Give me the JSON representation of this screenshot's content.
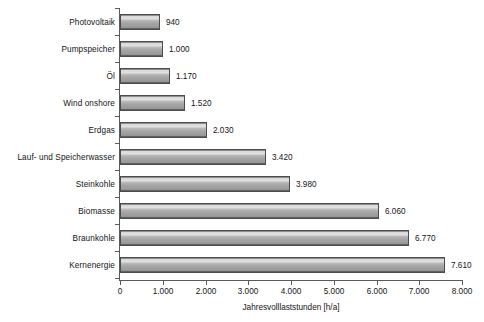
{
  "chart_data": {
    "type": "bar",
    "orientation": "horizontal",
    "title": "",
    "xlabel": "Jahresvolllaststunden [h/a]",
    "ylabel": "",
    "xlim": [
      0,
      8000
    ],
    "grid": false,
    "legend": null,
    "tick_labels": [
      "0",
      "1.000",
      "2.000",
      "3.000",
      "4.000",
      "5.000",
      "6.000",
      "7.000",
      "8.000"
    ],
    "tick_values": [
      0,
      1000,
      2000,
      3000,
      4000,
      5000,
      6000,
      7000,
      8000
    ],
    "categories": [
      "Photovoltaik",
      "Pumpspeicher",
      "Öl",
      "Wind onshore",
      "Erdgas",
      "Lauf- und Speicherwasser",
      "Steinkohle",
      "Biomasse",
      "Braunkohle",
      "Kernenergie"
    ],
    "values": [
      940,
      1000,
      1170,
      1520,
      2030,
      3420,
      3980,
      6060,
      6770,
      7610
    ],
    "value_labels": [
      "940",
      "1.000",
      "1.170",
      "1.520",
      "2.030",
      "3.420",
      "3.980",
      "6.060",
      "6.770",
      "7.610"
    ],
    "colors": {
      "bar_fill": "#a6a6a6",
      "bar_highlight": "#e2e2e2",
      "bar_shadow": "#6f6f6f",
      "bar_border": "#4c4c4c",
      "axis": "#5a5a5a",
      "text": "#141414",
      "background": "#ffffff"
    }
  }
}
